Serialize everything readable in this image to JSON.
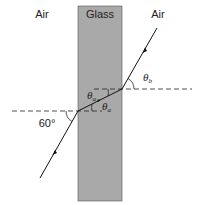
{
  "diagram": {
    "regions": {
      "left": "Air",
      "middle": "Glass",
      "right": "Air"
    },
    "angles": {
      "incident": "60°",
      "theta_a_symbol": "θ",
      "theta_a_sub": "a",
      "theta_b_symbol": "θ",
      "theta_b_sub": "b"
    },
    "colors": {
      "glass": "#a9a9a9",
      "ray": "#111111",
      "background": "#ffffff"
    }
  }
}
